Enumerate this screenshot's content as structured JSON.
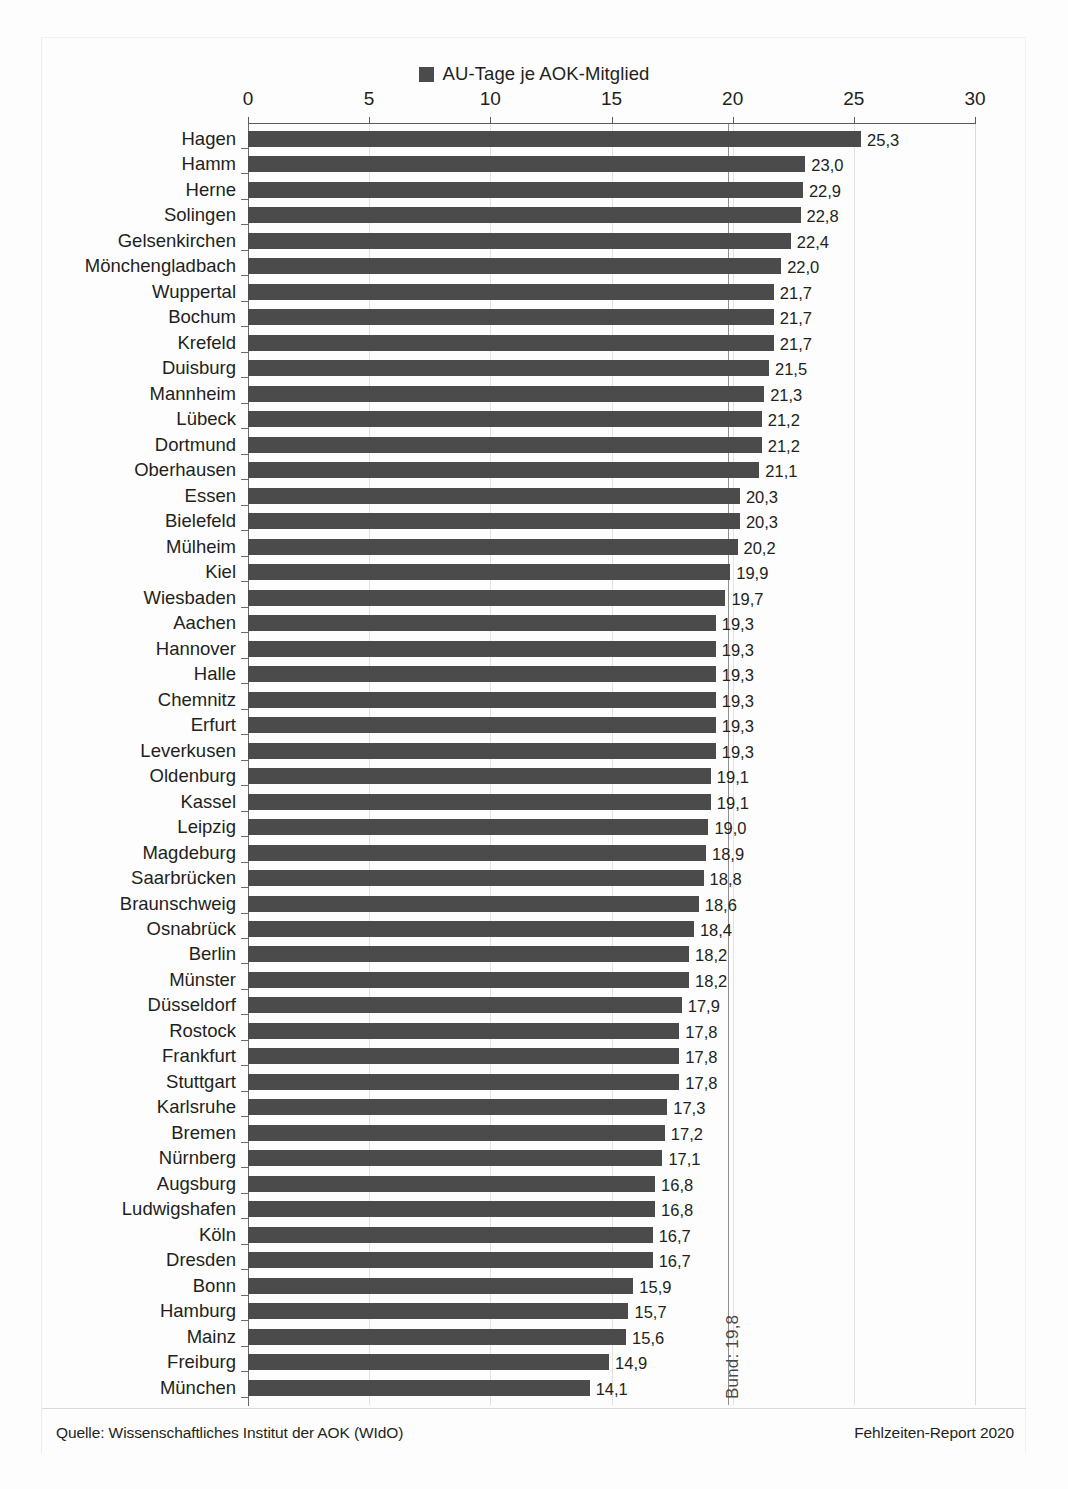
{
  "legend": {
    "label": "AU-Tage je AOK-Mitglied",
    "swatch_color": "#4b4b4b"
  },
  "footer": {
    "source": "Quelle: Wissenschaftliches Institut der AOK (WIdO)",
    "report": "Fehlzeiten-Report 2020"
  },
  "reference": {
    "label": "Bund: 19,8",
    "value": 19.8
  },
  "chart_data": {
    "type": "bar",
    "orientation": "horizontal",
    "title": "",
    "subtitle": "",
    "xlabel": "",
    "ylabel": "",
    "xlim": [
      0,
      30
    ],
    "xticks": [
      0,
      5,
      10,
      15,
      20,
      25,
      30
    ],
    "xtick_labels": [
      "0",
      "5",
      "10",
      "15",
      "20",
      "25",
      "30"
    ],
    "grid": true,
    "legend_position": "top-center",
    "legend_entries": [
      "AU-Tage je AOK-Mitglied"
    ],
    "bar_color": "#4b4b4b",
    "value_label_format": "comma-decimal",
    "reference_line": {
      "label": "Bund: 19,8",
      "value": 19.8
    },
    "categories": [
      "Hagen",
      "Hamm",
      "Herne",
      "Solingen",
      "Gelsenkirchen",
      "Mönchengladbach",
      "Wuppertal",
      "Bochum",
      "Krefeld",
      "Duisburg",
      "Mannheim",
      "Lübeck",
      "Dortmund",
      "Oberhausen",
      "Essen",
      "Bielefeld",
      "Mülheim",
      "Kiel",
      "Wiesbaden",
      "Aachen",
      "Hannover",
      "Halle",
      "Chemnitz",
      "Erfurt",
      "Leverkusen",
      "Oldenburg",
      "Kassel",
      "Leipzig",
      "Magdeburg",
      "Saarbrücken",
      "Braunschweig",
      "Osnabrück",
      "Berlin",
      "Münster",
      "Düsseldorf",
      "Rostock",
      "Frankfurt",
      "Stuttgart",
      "Karlsruhe",
      "Bremen",
      "Nürnberg",
      "Augsburg",
      "Ludwigshafen",
      "Köln",
      "Dresden",
      "Bonn",
      "Hamburg",
      "Mainz",
      "Freiburg",
      "München"
    ],
    "values": [
      25.3,
      23.0,
      22.9,
      22.8,
      22.4,
      22.0,
      21.7,
      21.7,
      21.7,
      21.5,
      21.3,
      21.2,
      21.2,
      21.1,
      20.3,
      20.3,
      20.2,
      19.9,
      19.7,
      19.3,
      19.3,
      19.3,
      19.3,
      19.3,
      19.3,
      19.1,
      19.1,
      19.0,
      18.9,
      18.8,
      18.6,
      18.4,
      18.2,
      18.2,
      17.9,
      17.8,
      17.8,
      17.8,
      17.3,
      17.2,
      17.1,
      16.8,
      16.8,
      16.7,
      16.7,
      15.9,
      15.7,
      15.6,
      14.9,
      14.1
    ],
    "value_labels": [
      "25,3",
      "23,0",
      "22,9",
      "22,8",
      "22,4",
      "22,0",
      "21,7",
      "21,7",
      "21,7",
      "21,5",
      "21,3",
      "21,2",
      "21,2",
      "21,1",
      "20,3",
      "20,3",
      "20,2",
      "19,9",
      "19,7",
      "19,3",
      "19,3",
      "19,3",
      "19,3",
      "19,3",
      "19,3",
      "19,1",
      "19,1",
      "19,0",
      "18,9",
      "18,8",
      "18,6",
      "18,4",
      "18,2",
      "18,2",
      "17,9",
      "17,8",
      "17,8",
      "17,8",
      "17,3",
      "17,2",
      "17,1",
      "16,8",
      "16,8",
      "16,7",
      "16,7",
      "15,9",
      "15,7",
      "15,6",
      "14,9",
      "14,1"
    ]
  }
}
